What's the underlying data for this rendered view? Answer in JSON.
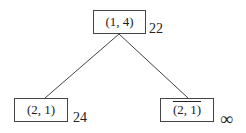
{
  "tree": {
    "root": {
      "label": "(1, 4)",
      "cost": "22"
    },
    "left": {
      "label": "(2, 1)",
      "cost": "24",
      "negated": false
    },
    "right": {
      "label": "(2, 1)",
      "cost": "∞",
      "negated": true
    }
  },
  "colors": {
    "stroke": "#444444",
    "text": "#222222",
    "background": "#ffffff"
  }
}
